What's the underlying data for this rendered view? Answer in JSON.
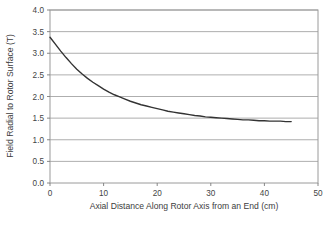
{
  "chart_data": {
    "type": "line",
    "title": "",
    "xlabel": "Axial Distance Along Rotor Axis from an End (cm)",
    "ylabel": "Field Radial to Rotor Surface (T)",
    "xlim": [
      0,
      50
    ],
    "ylim": [
      0,
      4.0
    ],
    "xticks": [
      0,
      10,
      20,
      30,
      40,
      50
    ],
    "yticks": [
      0.0,
      0.5,
      1.0,
      1.5,
      2.0,
      2.5,
      3.0,
      3.5,
      4.0
    ],
    "xtick_labels": [
      "0",
      "10",
      "20",
      "30",
      "40",
      "50"
    ],
    "ytick_labels": [
      "0.0",
      "0.5",
      "1.0",
      "1.5",
      "2.0",
      "2.5",
      "3.0",
      "3.5",
      "4.0"
    ],
    "grid": {
      "horizontal": true,
      "vertical": false,
      "color": "#999999"
    },
    "legend": {
      "visible": false,
      "position": "none"
    },
    "plot_border_color": "#9a9a9a",
    "background_color": "#ffffff",
    "series": [
      {
        "name": "Field Radial to Rotor Surface",
        "color": "#333333",
        "line_width": 1.4,
        "marker": "none",
        "x": [
          0,
          1,
          2,
          3,
          4,
          5,
          6,
          7,
          8,
          9,
          10,
          11,
          12,
          13,
          14,
          15,
          16,
          17,
          18,
          19,
          20,
          21,
          22,
          23,
          24,
          25,
          26,
          27,
          28,
          29,
          30,
          31,
          32,
          33,
          34,
          35,
          36,
          37,
          38,
          39,
          40,
          41,
          42,
          43,
          44,
          45
        ],
        "y": [
          3.37,
          3.21,
          3.05,
          2.9,
          2.76,
          2.63,
          2.52,
          2.42,
          2.33,
          2.25,
          2.17,
          2.1,
          2.04,
          1.99,
          1.94,
          1.89,
          1.85,
          1.81,
          1.78,
          1.75,
          1.72,
          1.69,
          1.66,
          1.64,
          1.62,
          1.6,
          1.58,
          1.56,
          1.55,
          1.53,
          1.52,
          1.51,
          1.5,
          1.49,
          1.48,
          1.47,
          1.46,
          1.46,
          1.45,
          1.44,
          1.44,
          1.43,
          1.43,
          1.43,
          1.42,
          1.42
        ]
      }
    ]
  },
  "axes": {
    "x_title": "Axial Distance Along Rotor Axis from an End (cm)",
    "y_title": "Field Radial to Rotor Surface (T)"
  }
}
